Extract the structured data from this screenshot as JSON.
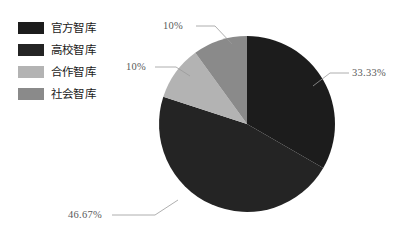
{
  "chart_data": {
    "type": "pie",
    "title": "",
    "categories": [
      "官方智库",
      "高校智库",
      "合作智库",
      "社会智库"
    ],
    "values": [
      33.33,
      46.67,
      10,
      10
    ],
    "value_labels": [
      "33.33%",
      "46.67%",
      "10%",
      "10%"
    ],
    "colors": [
      "#1c1c1c",
      "#242424",
      "#b3b3b3",
      "#8a8a8a"
    ],
    "legend_position": "left",
    "grid": false,
    "start_angle_deg": 0,
    "direction": "clockwise"
  },
  "legend": {
    "items": [
      {
        "label": "官方智库",
        "color": "#1c1c1c"
      },
      {
        "label": "高校智库",
        "color": "#242424"
      },
      {
        "label": "合作智库",
        "color": "#b3b3b3"
      },
      {
        "label": "社会智库",
        "color": "#8a8a8a"
      }
    ]
  },
  "labels": {
    "top": "10%",
    "left": "10%",
    "right": "33.33%",
    "bottom": "46.67%"
  }
}
